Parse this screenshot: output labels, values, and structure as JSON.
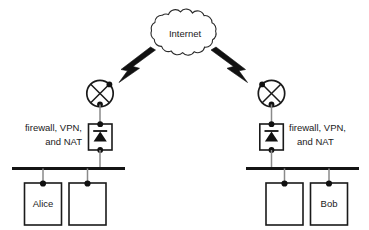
{
  "diagram": {
    "cloud": {
      "label": "Internet",
      "icon": "cloud-icon"
    },
    "left_site": {
      "annotation_line1": "firewall, VPN,",
      "annotation_line2": "and NAT",
      "router": {
        "icon": "router-circle-x-icon",
        "label": ""
      },
      "gateway": {
        "icon": "diode-firewall-icon",
        "label": ""
      },
      "bus": {
        "label": ""
      },
      "hosts": [
        {
          "label": "Alice",
          "icon": "host-box-icon"
        },
        {
          "label": "",
          "icon": "host-box-icon"
        }
      ]
    },
    "right_site": {
      "annotation_line1": "firewall, VPN,",
      "annotation_line2": "and NAT",
      "router": {
        "icon": "router-circle-x-icon",
        "label": ""
      },
      "gateway": {
        "icon": "diode-firewall-icon",
        "label": ""
      },
      "bus": {
        "label": ""
      },
      "hosts": [
        {
          "label": "",
          "icon": "host-box-icon"
        },
        {
          "label": "Bob",
          "icon": "host-box-icon"
        }
      ]
    },
    "links": [
      {
        "name": "left-router-to-internet",
        "icon": "lightning-bolt-icon"
      },
      {
        "name": "right-router-to-internet",
        "icon": "lightning-bolt-icon"
      }
    ],
    "colors": {
      "ink": "#1a1a1a",
      "bus": "#141414",
      "wire": "#8a8a8a",
      "fill": "#ffffff"
    }
  }
}
